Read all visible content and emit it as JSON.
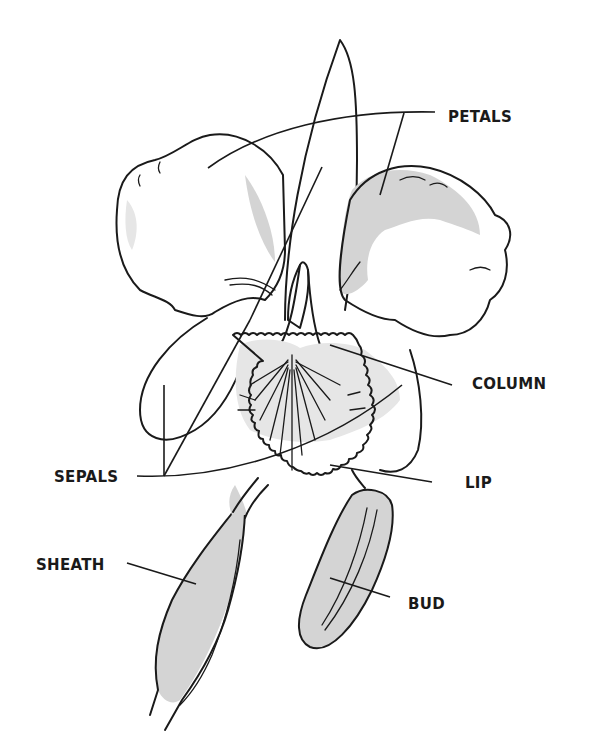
{
  "diagram": {
    "labels": [
      {
        "id": "petals",
        "text": "PETALS"
      },
      {
        "id": "column",
        "text": "COLUMN"
      },
      {
        "id": "sepals",
        "text": "SEPALS"
      },
      {
        "id": "lip",
        "text": "LIP"
      },
      {
        "id": "sheath",
        "text": "SHEATH"
      },
      {
        "id": "bud",
        "text": "BUD"
      }
    ],
    "colors": {
      "ink": "#1a1a1a",
      "shading": "#d4d4d4",
      "background": "#ffffff"
    }
  }
}
